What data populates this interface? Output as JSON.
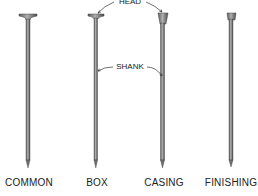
{
  "diagram": {
    "type": "nail-types-illustration",
    "callouts": {
      "head": "HEAD",
      "shank": "SHANK"
    },
    "nails": [
      {
        "name": "common",
        "label": "COMMON",
        "head_style": "flat-wide"
      },
      {
        "name": "box",
        "label": "BOX",
        "head_style": "flat"
      },
      {
        "name": "casing",
        "label": "CASING",
        "head_style": "conical"
      },
      {
        "name": "finishing",
        "label": "FINISHING",
        "head_style": "small-barrel"
      }
    ],
    "colors": {
      "nail_fill": "#8c8c8c",
      "nail_dark": "#555555",
      "text": "#222222",
      "background": "#ffffff"
    }
  }
}
